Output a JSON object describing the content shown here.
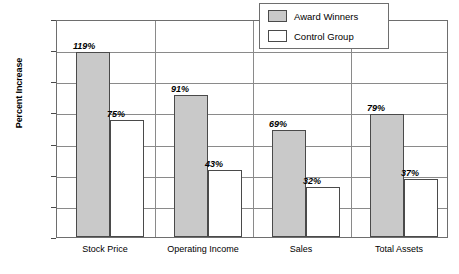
{
  "chart_data": {
    "type": "bar",
    "title": "",
    "xlabel": "",
    "ylabel": "Percent Increase",
    "ylim": [
      0,
      140
    ],
    "yticks": [
      0,
      20,
      40,
      60,
      80,
      100,
      120,
      140
    ],
    "ytick_labels": [
      "0",
      "20",
      "40",
      "60",
      "80",
      "100",
      "120",
      "140"
    ],
    "grid": true,
    "legend_position": "top-right",
    "categories": [
      "Stock Price",
      "Operating Income",
      "Sales",
      "Total Assets"
    ],
    "series": [
      {
        "name": "Award Winners",
        "color": "#c9c9c9",
        "values": [
          119,
          91,
          69,
          79
        ],
        "value_labels": [
          "119%",
          "91%",
          "69%",
          "79%"
        ]
      },
      {
        "name": "Control Group",
        "color": "#ffffff",
        "values": [
          75,
          43,
          32,
          37
        ],
        "value_labels": [
          "75%",
          "43%",
          "32%",
          "37%"
        ]
      }
    ]
  },
  "legend": {
    "entries": [
      {
        "label": "Award Winners",
        "swatch": "#c9c9c9"
      },
      {
        "label": "Control Group",
        "swatch": "#ffffff"
      }
    ]
  },
  "axes": {
    "y_title": "Percent Increase"
  }
}
